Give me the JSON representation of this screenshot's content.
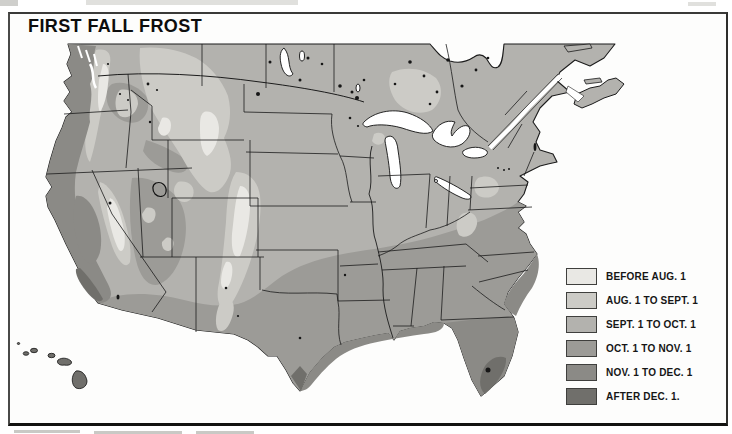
{
  "map": {
    "title": "FIRST FALL FROST",
    "legend": {
      "items": [
        {
          "label": "BEFORE AUG. 1",
          "color": "#e9e8e4"
        },
        {
          "label": "AUG. 1 TO SEPT. 1",
          "color": "#cccbc6"
        },
        {
          "label": "SEPT. 1 TO OCT. 1",
          "color": "#b3b2ae"
        },
        {
          "label": "OCT. 1 TO NOV. 1",
          "color": "#9c9b97"
        },
        {
          "label": "NOV. 1 TO DEC. 1",
          "color": "#8b8a86"
        },
        {
          "label": "AFTER DEC. 1.",
          "color": "#706f6b"
        }
      ]
    },
    "colors": {
      "outline": "#1b1b1b",
      "water": "#ffffff",
      "frame": "#2e2e2c",
      "lake_dot": "#161616"
    }
  }
}
